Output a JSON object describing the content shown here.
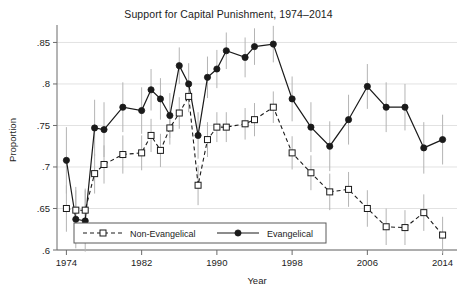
{
  "chart_data": {
    "type": "line",
    "title": "Support for Capital Punishment, 1974–2014",
    "xlabel": "Year",
    "ylabel": "Proportion",
    "xlim": [
      1973,
      2015
    ],
    "ylim": [
      0.6,
      0.865
    ],
    "xticks": [
      1974,
      1982,
      1990,
      1998,
      2006,
      2014
    ],
    "xtick_labels": [
      "1974",
      "1982",
      "1990",
      "1998",
      "2006",
      "2014"
    ],
    "yticks": [
      0.6,
      0.65,
      0.7,
      0.75,
      0.8,
      0.85
    ],
    "ytick_labels": [
      ".6",
      ".65",
      ".7",
      ".75",
      ".8",
      ".85"
    ],
    "grid": true,
    "grid_axis": "y",
    "legend_position": "bottom-left-inside",
    "error_bars": "95% confidence interval",
    "series": [
      {
        "name": "Evangelical",
        "marker": "filled-circle",
        "line_style": "solid",
        "color": "#1a1a1a",
        "x": [
          1974,
          1975,
          1976,
          1977,
          1978,
          1980,
          1982,
          1983,
          1984,
          1985,
          1986,
          1987,
          1988,
          1989,
          1990,
          1991,
          1993,
          1994,
          1996,
          1998,
          2000,
          2002,
          2004,
          2006,
          2008,
          2010,
          2012,
          2014
        ],
        "values": [
          0.708,
          0.637,
          0.635,
          0.747,
          0.745,
          0.772,
          0.768,
          0.793,
          0.782,
          0.762,
          0.822,
          0.8,
          0.738,
          0.808,
          0.818,
          0.84,
          0.832,
          0.845,
          0.848,
          0.782,
          0.748,
          0.725,
          0.757,
          0.797,
          0.772,
          0.772,
          0.723,
          0.733
        ],
        "ci_low": [
          0.668,
          0.602,
          0.598,
          0.713,
          0.712,
          0.742,
          0.74,
          0.768,
          0.757,
          0.735,
          0.8,
          0.775,
          0.71,
          0.783,
          0.795,
          0.818,
          0.808,
          0.823,
          0.826,
          0.755,
          0.718,
          0.695,
          0.727,
          0.77,
          0.742,
          0.744,
          0.692,
          0.703
        ],
        "ci_high": [
          0.748,
          0.672,
          0.672,
          0.781,
          0.778,
          0.802,
          0.796,
          0.818,
          0.807,
          0.789,
          0.844,
          0.825,
          0.766,
          0.833,
          0.841,
          0.862,
          0.856,
          0.867,
          0.87,
          0.809,
          0.778,
          0.755,
          0.787,
          0.824,
          0.802,
          0.8,
          0.754,
          0.763
        ]
      },
      {
        "name": "Non-Evangelical",
        "marker": "open-square",
        "line_style": "dashed",
        "color": "#1a1a1a",
        "x": [
          1974,
          1975,
          1976,
          1977,
          1978,
          1980,
          1982,
          1983,
          1984,
          1985,
          1986,
          1987,
          1988,
          1989,
          1990,
          1991,
          1993,
          1994,
          1996,
          1998,
          2000,
          2002,
          2004,
          2006,
          2008,
          2010,
          2012,
          2014
        ],
        "values": [
          0.65,
          0.648,
          0.648,
          0.692,
          0.703,
          0.715,
          0.717,
          0.738,
          0.72,
          0.747,
          0.765,
          0.785,
          0.678,
          0.733,
          0.748,
          0.748,
          0.752,
          0.757,
          0.772,
          0.717,
          0.693,
          0.67,
          0.673,
          0.65,
          0.628,
          0.627,
          0.645,
          0.618
        ],
        "ci_low": [
          0.622,
          0.62,
          0.622,
          0.668,
          0.68,
          0.692,
          0.696,
          0.718,
          0.7,
          0.727,
          0.746,
          0.766,
          0.654,
          0.712,
          0.73,
          0.73,
          0.733,
          0.737,
          0.753,
          0.697,
          0.672,
          0.648,
          0.652,
          0.628,
          0.606,
          0.606,
          0.623,
          0.596
        ],
        "ci_high": [
          0.678,
          0.676,
          0.674,
          0.716,
          0.726,
          0.738,
          0.738,
          0.758,
          0.74,
          0.767,
          0.784,
          0.804,
          0.702,
          0.754,
          0.766,
          0.766,
          0.771,
          0.777,
          0.791,
          0.737,
          0.714,
          0.692,
          0.694,
          0.672,
          0.65,
          0.648,
          0.667,
          0.64
        ]
      }
    ]
  },
  "legend": {
    "entries": [
      {
        "label": "Non-Evangelical",
        "marker": "open-square",
        "style": "dashed"
      },
      {
        "label": "Evangelical",
        "marker": "filled-circle",
        "style": "solid"
      }
    ]
  }
}
